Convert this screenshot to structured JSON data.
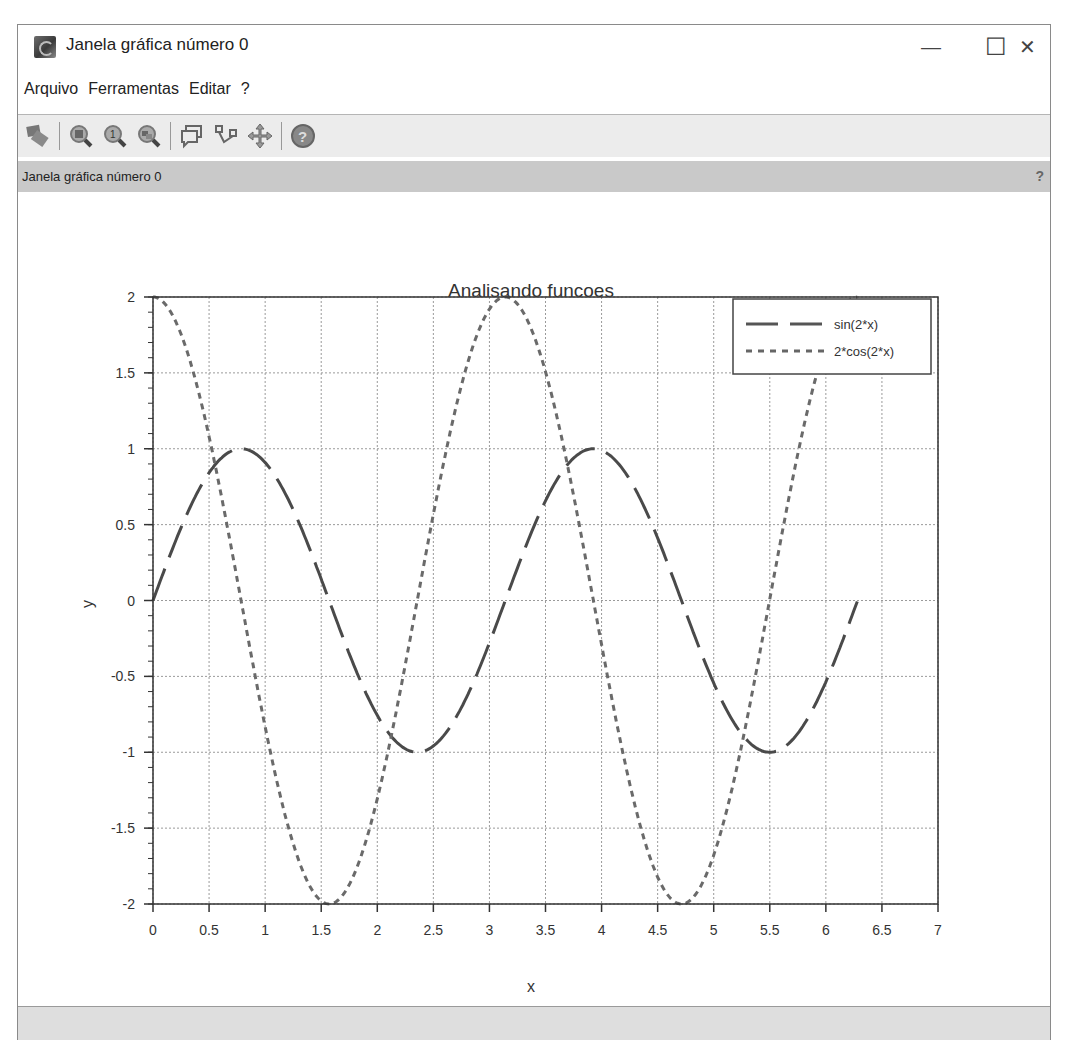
{
  "window": {
    "title": "Janela gráfica número 0",
    "controls": {
      "minimize": "—",
      "maximize": "☐",
      "close": "✕"
    }
  },
  "menu": {
    "items": [
      "Arquivo",
      "Ferramentas",
      "Editar",
      "?"
    ]
  },
  "toolbar": {
    "buttons": [
      {
        "name": "select-figure-icon"
      },
      {
        "name": "zoom-icon"
      },
      {
        "name": "zoom-original-icon"
      },
      {
        "name": "zoom-out-icon"
      },
      {
        "name": "datatip-icon"
      },
      {
        "name": "edit-curve-icon"
      },
      {
        "name": "pan-icon"
      },
      {
        "name": "help-icon"
      }
    ]
  },
  "infobar": {
    "text": "Janela gráfica número 0",
    "help": "?"
  },
  "colors": {
    "line": "#555555",
    "grid": "#9a9a9a",
    "axis": "#333333",
    "infobar_bg": "#c9c9c9",
    "toolbar_bg": "#ececec"
  },
  "chart_data": {
    "type": "line",
    "title": "Analisando funcoes",
    "xlabel": "x",
    "ylabel": "y",
    "xlim": [
      0,
      7
    ],
    "ylim": [
      -2,
      2
    ],
    "xticks": [
      "0",
      "0.5",
      "1",
      "1.5",
      "2",
      "2.5",
      "3",
      "3.5",
      "4",
      "4.5",
      "5",
      "5.5",
      "6",
      "6.5",
      "7"
    ],
    "yticks": [
      "2",
      "1.5",
      "1",
      "0.5",
      "0",
      "-0.5",
      "-1",
      "-1.5",
      "-2"
    ],
    "grid": true,
    "legend_position": "upper right",
    "x": [
      0,
      0.39,
      0.79,
      1.18,
      1.57,
      1.96,
      2.36,
      2.75,
      3.14,
      3.53,
      3.93,
      4.32,
      4.71,
      5.1,
      5.5,
      5.89,
      6.28
    ],
    "series": [
      {
        "name": "sin(2*x)",
        "style": "long-dash",
        "values": [
          0,
          0.71,
          1,
          0.71,
          0,
          -0.71,
          -1,
          -0.71,
          0,
          0.71,
          1,
          0.71,
          0,
          -0.71,
          -1,
          -0.71,
          0
        ]
      },
      {
        "name": "2*cos(2*x)",
        "style": "dotted",
        "values": [
          2,
          1.41,
          0,
          -1.41,
          -2,
          -1.41,
          0,
          1.41,
          2,
          1.41,
          0,
          -1.41,
          -2,
          -1.41,
          0,
          1.41,
          2
        ]
      }
    ]
  }
}
